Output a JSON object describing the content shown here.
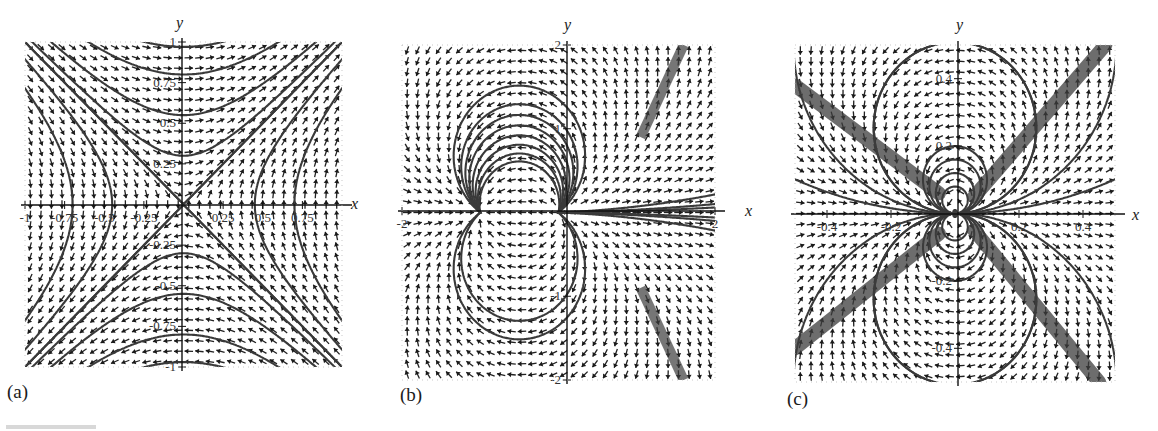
{
  "figure": {
    "panels": [
      {
        "id": "a",
        "label": "(a)"
      },
      {
        "id": "b",
        "label": "(b)"
      },
      {
        "id": "c",
        "label": "(c)"
      }
    ],
    "axis_names": {
      "x": "x",
      "y": "y"
    }
  },
  "chart_data": [
    {
      "type": "vector-field",
      "panel": "(a)",
      "title": "",
      "xlabel": "x",
      "ylabel": "y",
      "xlim": [
        -1,
        1
      ],
      "ylim": [
        -1,
        1
      ],
      "x_ticks": [
        "-1",
        "-0.75",
        "-0.5",
        "-0.25",
        "0.25",
        "0.5",
        "0.75"
      ],
      "y_ticks": [
        "1",
        "0.75",
        "0.5",
        "0.25",
        "-0.25",
        "-0.5",
        "-0.75",
        "-1"
      ],
      "field": {
        "dx": "y",
        "dy": "x"
      },
      "trajectories": "hyperbolas x^2 - y^2 = c with separatrices y = x and y = -x",
      "equilibria": [
        {
          "x": 0,
          "y": 0,
          "kind": "saddle"
        }
      ],
      "grid": false
    },
    {
      "type": "vector-field",
      "panel": "(b)",
      "title": "",
      "xlabel": "x",
      "ylabel": "y",
      "xlim": [
        -2,
        2
      ],
      "ylim": [
        -2,
        2
      ],
      "x_ticks": [
        "-2",
        "2"
      ],
      "y_ticks": [
        "2",
        "1",
        "-1",
        "-2"
      ],
      "field": {
        "dx": "x^2 + x - y^2",
        "dy": "y(2x + 1)"
      },
      "trajectories": "closed orbits around center near (-1, 0); saddle at origin; thick bundles toward upper-right and lower-right",
      "equilibria": [
        {
          "x": -1,
          "y": 0,
          "kind": "center"
        },
        {
          "x": 0,
          "y": 0,
          "kind": "saddle"
        }
      ],
      "grid": false
    },
    {
      "type": "vector-field",
      "panel": "(c)",
      "title": "",
      "xlabel": "x",
      "ylabel": "y",
      "xlim": [
        -0.5,
        0.5
      ],
      "ylim": [
        -0.5,
        0.5
      ],
      "x_ticks": [
        "-0.4",
        "-0.2",
        "0.2",
        "0.4"
      ],
      "y_ticks": [
        "0.4",
        "0.2",
        "-0.2",
        "-0.4"
      ],
      "field": {
        "dx": "x^2 - y^2",
        "dy": "2xy"
      },
      "trajectories": "saddle-like X pattern with thick dark bands along both diagonals",
      "equilibria": [
        {
          "x": 0,
          "y": 0,
          "kind": "degenerate saddle"
        }
      ],
      "grid": false
    }
  ]
}
